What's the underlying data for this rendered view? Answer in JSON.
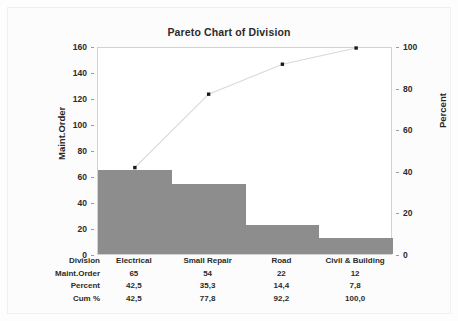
{
  "chart_data": {
    "type": "bar",
    "title": "Pareto Chart of Division",
    "xlabel": "Division",
    "ylabel": "Maint.Order",
    "y2label": "Percent",
    "categories": [
      "Electrical",
      "Small Repair",
      "Road",
      "Civil & Building"
    ],
    "values": [
      65,
      54,
      22,
      12
    ],
    "series": [
      {
        "name": "Maint.Order",
        "values": [
          65,
          54,
          22,
          12
        ]
      },
      {
        "name": "Cum %",
        "values": [
          42.5,
          77.8,
          92.2,
          100.0
        ]
      }
    ],
    "percent": [
      42.5,
      35.3,
      14.4,
      7.8
    ],
    "cum_percent": [
      42.5,
      77.8,
      92.2,
      100.0
    ],
    "ylim": [
      0,
      160
    ],
    "y2lim": [
      0,
      100
    ],
    "yticks": [
      0,
      20,
      40,
      60,
      80,
      100,
      120,
      140,
      160
    ],
    "y2ticks": [
      0,
      20,
      40,
      60,
      80,
      100
    ],
    "ytick_labels": [
      "0",
      "20",
      "40",
      "60",
      "80",
      "100",
      "120",
      "140",
      "160"
    ],
    "y2tick_labels": [
      "0",
      "20",
      "40",
      "60",
      "80",
      "100"
    ],
    "grid": false,
    "legend": "none",
    "bar_color": "#8d8d8d",
    "line_color": "#d9d9d9",
    "marker_color": "#1a1a1a"
  },
  "table": {
    "rows": [
      {
        "label": "Division",
        "cells": [
          "Electrical",
          "Small Repair",
          "Road",
          "Civil & Building"
        ]
      },
      {
        "label": "Maint.Order",
        "cells": [
          "65",
          "54",
          "22",
          "12"
        ]
      },
      {
        "label": "Percent",
        "cells": [
          "42,5",
          "35,3",
          "14,4",
          "7,8"
        ]
      },
      {
        "label": "Cum %",
        "cells": [
          "42,5",
          "77,8",
          "92,2",
          "100,0"
        ]
      }
    ]
  }
}
